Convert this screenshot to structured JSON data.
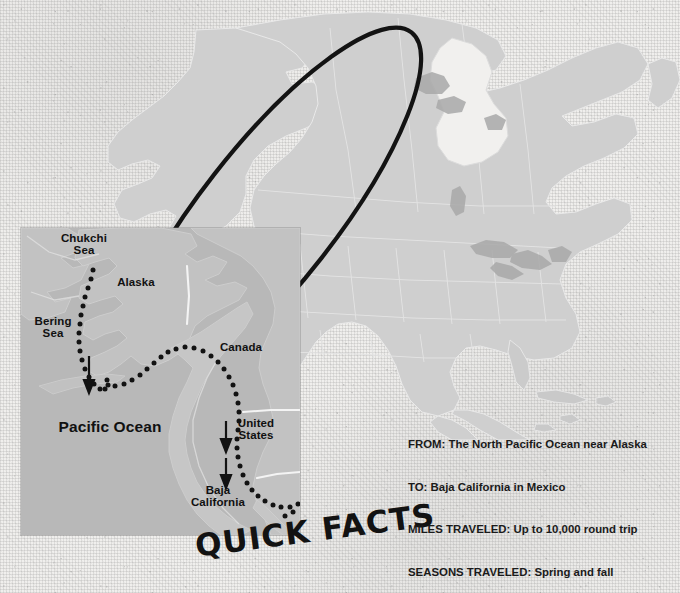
{
  "theme": {
    "paper_color": "#f0efed",
    "land_color": "#cfcfcf",
    "land_stroke": "#e8e8e8",
    "inset_ocean_color": "#b7b7b7",
    "inset_land_color": "#c3c3c3",
    "highlight_color": "#111111",
    "text_color": "#1a1a1a"
  },
  "title": {
    "text": "QUICK FACTS"
  },
  "main_map": {
    "name": "north-america-map",
    "highlight_region_label": "North Pacific Ocean near Alaska migration range"
  },
  "inset_map": {
    "name": "migration-route-inset",
    "labels": [
      {
        "id": "chukchi-sea",
        "text": "Chukchi\nSea",
        "x": 78,
        "y": 236,
        "size": 11.5
      },
      {
        "id": "alaska",
        "text": "Alaska",
        "x": 133,
        "y": 277,
        "size": 11.5
      },
      {
        "id": "bering-sea",
        "text": "Bering\nSea",
        "x": 48,
        "y": 316,
        "size": 11.5
      },
      {
        "id": "canada",
        "text": "Canada",
        "x": 238,
        "y": 341,
        "size": 11.5
      },
      {
        "id": "pacific-ocean",
        "text": "Pacific Ocean",
        "x": 114,
        "y": 421,
        "size": 15.5
      },
      {
        "id": "united-states",
        "text": "United\nStates",
        "x": 255,
        "y": 418,
        "size": 11.5
      },
      {
        "id": "baja-california",
        "text": "Baja\nCalifornia",
        "x": 209,
        "y": 486,
        "size": 11.5
      }
    ],
    "route_description": "Dotted migration route from the Chukchi Sea south through the Bering Sea along the Pacific coast to Baja California",
    "direction_arrows": 3
  },
  "facts": [
    {
      "key": "FROM:",
      "value": "The North Pacific Ocean near Alaska"
    },
    {
      "key": "TO:",
      "value": "Baja California in Mexico"
    },
    {
      "key": "MILES TRAVELED:",
      "value": "Up to 10,000 round trip"
    },
    {
      "key": "SEASONS TRAVELED:",
      "value": "Spring and fall"
    }
  ]
}
